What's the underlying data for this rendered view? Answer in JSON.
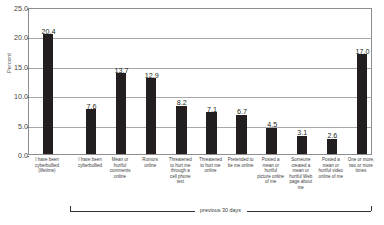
{
  "chart_data": {
    "type": "bar",
    "title": "",
    "subtitle": "",
    "xlabel": "",
    "ylabel": "Percent",
    "ylim": [
      0.0,
      25.0
    ],
    "ytick_labels": [
      "0.0",
      "5.0",
      "10.0",
      "15.0",
      "20.0",
      "25.0"
    ],
    "ytick_values": [
      0.0,
      5.0,
      10.0,
      15.0,
      20.0,
      25.0
    ],
    "grid": true,
    "legend": "none",
    "categories": [
      "I have been cyberbullied (lifetime)",
      "I have been cyberbullied",
      "Mean or hurtful comments online",
      "Rumors online",
      "Threatened to hurt me through a cell phone text",
      "Threatened to hurt me online",
      "Pretended to be me online",
      "Posted a mean or hurtful picture online of me",
      "Someone created a mean or hurtful Web page about me",
      "Posted a mean or hurtful video online of me",
      "One or more, two or more times"
    ],
    "values": [
      20.4,
      7.6,
      13.7,
      12.9,
      8.2,
      7.1,
      6.7,
      4.5,
      3.1,
      2.6,
      17.0
    ],
    "value_labels": [
      "20.4",
      "7.6",
      "13.7",
      "12.9",
      "8.2",
      "7.1",
      "6.7",
      "4.5",
      "3.1",
      "2.6",
      "17.0"
    ],
    "bar_color": "#231f20",
    "annotations": [
      {
        "name": "previous-30-days-bracket",
        "text": "previous 30 days",
        "spans_categories": [
          1,
          10
        ]
      }
    ]
  }
}
